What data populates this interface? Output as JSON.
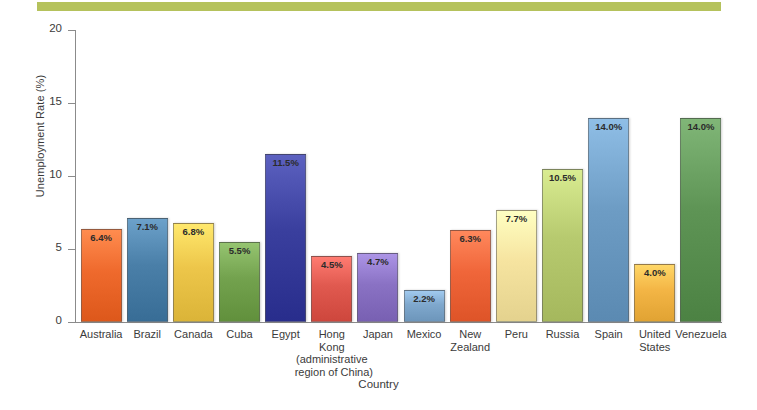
{
  "figure": {
    "accent_band_color": "#b5c25c",
    "background_color": "#ffffff",
    "axis_color": "#8b8b8b"
  },
  "chart_data": {
    "type": "bar",
    "title": "",
    "xlabel": "Country",
    "ylabel": "Unemployment Rate (%)",
    "ylim": [
      0,
      20
    ],
    "yticks": [
      0,
      5,
      10,
      15,
      20
    ],
    "ytick_labels": [
      "0",
      "5",
      "10",
      "15",
      "20"
    ],
    "grid": false,
    "legend": false,
    "categories": [
      "Australia",
      "Brazil",
      "Canada",
      "Cuba",
      "Egypt",
      "Hong Kong (administrative region of China)",
      "Japan",
      "Mexico",
      "New Zealand",
      "Peru",
      "Russia",
      "Spain",
      "United States",
      "Venezuela"
    ],
    "values": [
      6.4,
      7.1,
      6.8,
      5.5,
      11.5,
      4.5,
      4.7,
      2.2,
      6.3,
      7.7,
      10.5,
      14.0,
      4.0,
      14.0
    ],
    "value_labels": [
      "6.4%",
      "7.1%",
      "6.8%",
      "5.5%",
      "11.5%",
      "4.5%",
      "4.7%",
      "2.2%",
      "6.3%",
      "7.7%",
      "10.5%",
      "14.0%",
      "4.0%",
      "14.0%"
    ],
    "bar_colors": [
      "#ef6a2d",
      "#4a7fa8",
      "#edc64a",
      "#73a24e",
      "#3a3f9e",
      "#e0594f",
      "#8a72c4",
      "#7fa8cd",
      "#f0663a",
      "#f6e4a0",
      "#b7ca6f",
      "#6d9cc4",
      "#f3b545",
      "#5e9455"
    ],
    "bar_labels": [
      {
        "line1": "Australia",
        "line2": "",
        "line3": "",
        "line4": ""
      },
      {
        "line1": "Brazil",
        "line2": "",
        "line3": "",
        "line4": ""
      },
      {
        "line1": "Canada",
        "line2": "",
        "line3": "",
        "line4": ""
      },
      {
        "line1": "Cuba",
        "line2": "",
        "line3": "",
        "line4": ""
      },
      {
        "line1": "Egypt",
        "line2": "",
        "line3": "",
        "line4": ""
      },
      {
        "line1": "Hong",
        "line2": "Kong",
        "line3": "(administrative",
        "line4": "region of China)"
      },
      {
        "line1": "Japan",
        "line2": "",
        "line3": "",
        "line4": ""
      },
      {
        "line1": "Mexico",
        "line2": "",
        "line3": "",
        "line4": ""
      },
      {
        "line1": "New",
        "line2": "Zealand",
        "line3": "",
        "line4": ""
      },
      {
        "line1": "Peru",
        "line2": "",
        "line3": "",
        "line4": ""
      },
      {
        "line1": "Russia",
        "line2": "",
        "line3": "",
        "line4": ""
      },
      {
        "line1": "Spain",
        "line2": "",
        "line3": "",
        "line4": ""
      },
      {
        "line1": "United",
        "line2": "States",
        "line3": "",
        "line4": ""
      },
      {
        "line1": "Venezuela",
        "line2": "",
        "line3": "",
        "line4": ""
      }
    ]
  }
}
